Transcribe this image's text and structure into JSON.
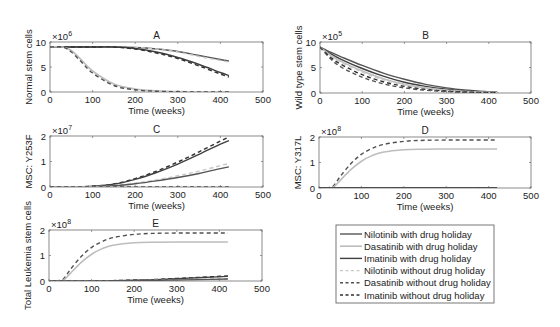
{
  "styles": {
    "nilotinib_holiday": {
      "color": "#555555",
      "dash": "",
      "width": 1.4
    },
    "dasatinib_holiday": {
      "color": "#bdbdbd",
      "dash": "",
      "width": 1.6
    },
    "imatinib_holiday": {
      "color": "#404040",
      "dash": "",
      "width": 1.4
    },
    "nilotinib_no_holiday": {
      "color": "#c8c8c8",
      "dash": "4,3",
      "width": 1.4
    },
    "dasatinib_no_holiday": {
      "color": "#505050",
      "dash": "4,3",
      "width": 1.4
    },
    "imatinib_no_holiday": {
      "color": "#303030",
      "dash": "4,3",
      "width": 1.4
    }
  },
  "legend": {
    "entries": [
      {
        "key": "nilotinib_holiday",
        "label": "Nilotinib with drug holiday"
      },
      {
        "key": "dasatinib_holiday",
        "label": "Dasatinib with drug holiday"
      },
      {
        "key": "imatinib_holiday",
        "label": "Imatinib with drug holiday"
      },
      {
        "key": "nilotinib_no_holiday",
        "label": "Nilotinib without drug holiday"
      },
      {
        "key": "dasatinib_no_holiday",
        "label": "Dasatinib without drug holiday"
      },
      {
        "key": "imatinib_no_holiday",
        "label": "Imatinib without drug holiday"
      }
    ]
  },
  "chart_data": [
    {
      "id": "A",
      "type": "line",
      "title": "A",
      "xlabel": "Time (weeks)",
      "ylabel": "Normal stem cells",
      "exponent": "×10^6",
      "xlim": [
        0,
        500
      ],
      "ylim": [
        0,
        10
      ],
      "xticks": [
        0,
        100,
        200,
        300,
        400,
        500
      ],
      "yticks": [
        0,
        5,
        10
      ],
      "box": {
        "left": 50,
        "top": 42,
        "right": 263,
        "bottom": 92
      },
      "x": [
        0,
        30,
        50,
        75,
        100,
        150,
        200,
        250,
        300,
        350,
        400,
        420
      ],
      "series": [
        {
          "key": "nilotinib_holiday",
          "values": [
            9,
            9,
            9,
            9,
            9,
            9,
            8.9,
            8.6,
            8.1,
            7.3,
            6.5,
            6.2
          ]
        },
        {
          "key": "nilotinib_no_holiday",
          "values": [
            9,
            9,
            9,
            9,
            9,
            9,
            8.9,
            8.6,
            8.0,
            7.1,
            6.3,
            6.0
          ]
        },
        {
          "key": "imatinib_holiday",
          "values": [
            9,
            9,
            9,
            9,
            9,
            9,
            8.7,
            8.0,
            6.9,
            5.5,
            3.9,
            3.3
          ]
        },
        {
          "key": "imatinib_no_holiday",
          "values": [
            9,
            9,
            9,
            9,
            9,
            9,
            8.6,
            7.8,
            6.7,
            5.2,
            3.6,
            3.0
          ]
        },
        {
          "key": "dasatinib_holiday",
          "values": [
            9,
            9,
            8.3,
            6.3,
            4.2,
            1.6,
            0.6,
            0.25,
            0.1,
            0.05,
            0.02,
            0.0
          ]
        },
        {
          "key": "dasatinib_no_holiday",
          "values": [
            9,
            9,
            8.0,
            5.9,
            3.8,
            1.3,
            0.45,
            0.15,
            0.05,
            0.02,
            0.0,
            0.0
          ]
        }
      ]
    },
    {
      "id": "B",
      "type": "line",
      "title": "B",
      "xlabel": "Time (weeks)",
      "ylabel": "Wild type stem cells",
      "exponent": "×10^5",
      "xlim": [
        0,
        500
      ],
      "ylim": [
        0,
        10
      ],
      "xticks": [
        0,
        100,
        200,
        300,
        400,
        500
      ],
      "yticks": [
        0,
        5,
        10
      ],
      "box": {
        "left": 320,
        "top": 42,
        "right": 531,
        "bottom": 93
      },
      "x": [
        0,
        25,
        50,
        100,
        150,
        200,
        250,
        300,
        350,
        400,
        420
      ],
      "series": [
        {
          "key": "nilotinib_holiday",
          "values": [
            9,
            8.0,
            7.1,
            5.4,
            3.9,
            2.7,
            1.7,
            1.0,
            0.55,
            0.25,
            0.15
          ]
        },
        {
          "key": "imatinib_holiday",
          "values": [
            9,
            7.7,
            6.6,
            4.8,
            3.3,
            2.1,
            1.3,
            0.75,
            0.4,
            0.18,
            0.1
          ]
        },
        {
          "key": "dasatinib_holiday",
          "values": [
            9,
            7.4,
            6.2,
            4.3,
            2.8,
            1.7,
            1.0,
            0.55,
            0.28,
            0.12,
            0.08
          ]
        },
        {
          "key": "nilotinib_no_holiday",
          "values": [
            9,
            7.3,
            6.0,
            4.1,
            2.6,
            1.6,
            0.9,
            0.5,
            0.25,
            0.1,
            0.06
          ]
        },
        {
          "key": "imatinib_no_holiday",
          "values": [
            9,
            7.0,
            5.6,
            3.6,
            2.2,
            1.3,
            0.7,
            0.38,
            0.18,
            0.08,
            0.05
          ]
        },
        {
          "key": "dasatinib_no_holiday",
          "values": [
            9,
            6.7,
            5.1,
            3.1,
            1.8,
            1.0,
            0.55,
            0.28,
            0.12,
            0.05,
            0.03
          ]
        }
      ]
    },
    {
      "id": "C",
      "type": "line",
      "title": "C",
      "xlabel": "Time (weeks)",
      "ylabel": "MSC: Y253F",
      "exponent": "×10^7",
      "xlim": [
        0,
        500
      ],
      "ylim": [
        0,
        2
      ],
      "xticks": [
        0,
        100,
        200,
        300,
        400,
        500
      ],
      "yticks": [
        0,
        1,
        2
      ],
      "box": {
        "left": 50,
        "top": 136,
        "right": 263,
        "bottom": 187
      },
      "x": [
        0,
        50,
        100,
        150,
        200,
        250,
        300,
        350,
        400,
        420
      ],
      "series": [
        {
          "key": "imatinib_no_holiday",
          "values": [
            0,
            0,
            0.03,
            0.12,
            0.33,
            0.62,
            0.98,
            1.38,
            1.8,
            1.96
          ]
        },
        {
          "key": "imatinib_holiday",
          "values": [
            0,
            0,
            0.03,
            0.11,
            0.3,
            0.57,
            0.9,
            1.28,
            1.68,
            1.82
          ]
        },
        {
          "key": "nilotinib_no_holiday",
          "values": [
            0,
            0,
            0.01,
            0.06,
            0.15,
            0.28,
            0.44,
            0.62,
            0.84,
            0.92
          ]
        },
        {
          "key": "nilotinib_holiday",
          "values": [
            0,
            0,
            0.01,
            0.05,
            0.13,
            0.24,
            0.37,
            0.53,
            0.72,
            0.79
          ]
        },
        {
          "key": "dasatinib_holiday",
          "values": [
            0,
            0,
            0,
            0,
            0,
            0,
            0,
            0,
            0,
            0
          ]
        },
        {
          "key": "dasatinib_no_holiday",
          "values": [
            0,
            0,
            0,
            0,
            0,
            0,
            0,
            0,
            0,
            0
          ]
        }
      ]
    },
    {
      "id": "D",
      "type": "line",
      "title": "D",
      "xlabel": "Time (weeks)",
      "ylabel": "MSC: Y317L",
      "exponent": "×10^8",
      "xlim": [
        0,
        500
      ],
      "ylim": [
        0,
        2
      ],
      "xticks": [
        0,
        100,
        200,
        300,
        400,
        500
      ],
      "yticks": [
        0,
        1,
        2
      ],
      "box": {
        "left": 319,
        "top": 137,
        "right": 531,
        "bottom": 188
      },
      "x": [
        0,
        25,
        35,
        50,
        75,
        100,
        125,
        150,
        200,
        250,
        300,
        350,
        420
      ],
      "series": [
        {
          "key": "dasatinib_no_holiday",
          "values": [
            0,
            0.02,
            0.1,
            0.45,
            0.95,
            1.32,
            1.55,
            1.7,
            1.83,
            1.87,
            1.88,
            1.88,
            1.88
          ]
        },
        {
          "key": "dasatinib_holiday",
          "values": [
            0,
            0.01,
            0.04,
            0.3,
            0.72,
            1.05,
            1.27,
            1.4,
            1.5,
            1.52,
            1.53,
            1.53,
            1.53
          ]
        },
        {
          "key": "nilotinib_holiday",
          "values": [
            0,
            0,
            0,
            0,
            0,
            0,
            0,
            0,
            0,
            0,
            0,
            0,
            0
          ]
        },
        {
          "key": "imatinib_holiday",
          "values": [
            0,
            0,
            0,
            0,
            0,
            0,
            0,
            0,
            0,
            0,
            0,
            0,
            0
          ]
        },
        {
          "key": "nilotinib_no_holiday",
          "values": [
            0,
            0,
            0,
            0,
            0,
            0,
            0,
            0,
            0,
            0,
            0,
            0,
            0
          ]
        },
        {
          "key": "imatinib_no_holiday",
          "values": [
            0,
            0,
            0,
            0,
            0,
            0,
            0,
            0,
            0,
            0,
            0,
            0,
            0
          ]
        }
      ]
    },
    {
      "id": "E",
      "type": "line",
      "title": "E",
      "xlabel": "Time (weeks)",
      "ylabel": "Total Leukemia stem cells",
      "exponent": "×10^8",
      "xlim": [
        0,
        500
      ],
      "ylim": [
        0,
        2
      ],
      "xticks": [
        0,
        100,
        200,
        300,
        400,
        500
      ],
      "yticks": [
        0,
        1,
        2
      ],
      "box": {
        "left": 49,
        "top": 230,
        "right": 262,
        "bottom": 281
      },
      "x": [
        0,
        25,
        35,
        50,
        75,
        100,
        125,
        150,
        200,
        250,
        300,
        350,
        420
      ],
      "series": [
        {
          "key": "dasatinib_no_holiday",
          "values": [
            0,
            0.02,
            0.1,
            0.45,
            0.95,
            1.32,
            1.55,
            1.7,
            1.83,
            1.87,
            1.88,
            1.88,
            1.88
          ]
        },
        {
          "key": "dasatinib_holiday",
          "values": [
            0,
            0.01,
            0.04,
            0.3,
            0.72,
            1.05,
            1.27,
            1.4,
            1.5,
            1.52,
            1.53,
            1.53,
            1.53
          ]
        },
        {
          "key": "imatinib_no_holiday",
          "values": [
            0,
            0,
            0,
            0,
            0,
            0.005,
            0.01,
            0.015,
            0.035,
            0.06,
            0.1,
            0.14,
            0.2
          ]
        },
        {
          "key": "imatinib_holiday",
          "values": [
            0,
            0,
            0,
            0,
            0,
            0.005,
            0.01,
            0.015,
            0.03,
            0.055,
            0.09,
            0.13,
            0.18
          ]
        },
        {
          "key": "nilotinib_no_holiday",
          "values": [
            0,
            0,
            0,
            0,
            0,
            0,
            0.005,
            0.01,
            0.015,
            0.03,
            0.045,
            0.065,
            0.09
          ]
        },
        {
          "key": "nilotinib_holiday",
          "values": [
            0,
            0,
            0,
            0,
            0,
            0,
            0.005,
            0.008,
            0.013,
            0.025,
            0.04,
            0.055,
            0.08
          ]
        }
      ]
    }
  ]
}
